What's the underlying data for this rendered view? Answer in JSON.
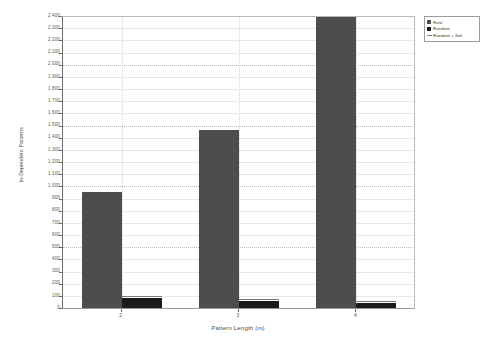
{
  "chart_data": {
    "type": "bar",
    "title": "",
    "xlabel": "Pattern Length (m)",
    "ylabel": "In-Dependent Patterns",
    "categories": [
      "2",
      "3",
      "4"
    ],
    "series": [
      {
        "name": "Real",
        "values": [
          950,
          1465,
          2395
        ],
        "color": "#4d4d4d"
      },
      {
        "name": "Random",
        "values": [
          80,
          55,
          45
        ],
        "color": "#1a1a1a"
      },
      {
        "name": "Random + Std",
        "values": [
          95,
          70,
          58
        ],
        "color": "#7a7a7a",
        "render": "line"
      }
    ],
    "ylim": [
      0,
      2400
    ],
    "ytick_step": 100,
    "yticks": [
      0,
      100,
      200,
      300,
      400,
      500,
      600,
      700,
      800,
      900,
      1000,
      1100,
      1200,
      1300,
      1400,
      1500,
      1600,
      1700,
      1800,
      1900,
      2000,
      2100,
      2200,
      2300,
      2400
    ],
    "ytick_labels": [
      "0",
      "100",
      "200",
      "300",
      "400",
      "500",
      "600",
      "700",
      "800",
      "900",
      "1 000",
      "1 100",
      "1 200",
      "1 300",
      "1 400",
      "1 500",
      "1 600",
      "1 700",
      "1 800",
      "1 900",
      "2 000",
      "2 100",
      "2 200",
      "2 300",
      "2 400"
    ],
    "major_gridline_step": 500,
    "grid": true,
    "legend_position": "top-right"
  },
  "legend": {
    "entries": [
      {
        "label": "Real"
      },
      {
        "label": "Random"
      },
      {
        "label": "Random + Std"
      }
    ]
  },
  "axes": {
    "x_title": "Pattern Length (m)",
    "y_title": "In-Dependent Patterns"
  }
}
